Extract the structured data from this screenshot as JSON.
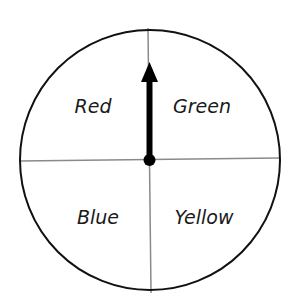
{
  "spinner": {
    "sections": [
      {
        "label": "Red"
      },
      {
        "label": "Green"
      },
      {
        "label": "Blue"
      },
      {
        "label": "Yellow"
      }
    ],
    "pointer_direction": "up"
  }
}
